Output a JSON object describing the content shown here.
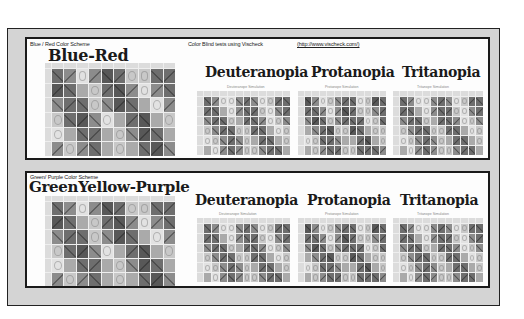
{
  "header": {
    "tests_label": "Color Blind tests using Vischeck",
    "tests_link": "(http://www.vischeck.com/)"
  },
  "panels": [
    {
      "scheme_label": "Blue / Red Color Scheme",
      "title": "Blue-Red",
      "simulations": [
        {
          "title": "Deuteranopia",
          "subtitle": "Deuteranope Simulation"
        },
        {
          "title": "Protanopia",
          "subtitle": "Protanope Simulation"
        },
        {
          "title": "Tritanopia",
          "subtitle": "Tritanope Simulation"
        }
      ]
    },
    {
      "scheme_label": "Green/ Purple Color Scheme",
      "title": "GreenYellow-Purple",
      "simulations": [
        {
          "title": "Deuteranopia",
          "subtitle": "Deuteranope Simulation"
        },
        {
          "title": "Protanopia",
          "subtitle": "Protanope Simulation"
        },
        {
          "title": "Tritanopia",
          "subtitle": "Tritanope Simulation"
        }
      ]
    }
  ],
  "matrix": {
    "rows": 6,
    "cols": 10,
    "shades": [
      [
        5,
        4,
        1,
        4,
        6,
        5,
        2,
        2,
        5,
        5
      ],
      [
        6,
        5,
        3,
        2,
        5,
        6,
        4,
        1,
        4,
        5
      ],
      [
        4,
        5,
        5,
        2,
        4,
        6,
        5,
        3,
        1,
        4
      ],
      [
        2,
        5,
        6,
        4,
        1,
        3,
        5,
        6,
        3,
        2
      ],
      [
        1,
        3,
        5,
        5,
        3,
        2,
        4,
        6,
        5,
        3
      ],
      [
        4,
        2,
        4,
        5,
        3,
        2,
        3,
        5,
        6,
        4
      ]
    ],
    "sim_shades": [
      [
        5,
        4,
        1,
        1,
        4,
        5,
        4,
        1,
        2,
        5,
        5
      ],
      [
        5,
        5,
        3,
        1,
        4,
        5,
        5,
        2,
        1,
        4,
        5
      ],
      [
        4,
        5,
        5,
        2,
        3,
        5,
        5,
        4,
        1,
        2,
        4
      ],
      [
        2,
        4,
        5,
        5,
        2,
        2,
        5,
        5,
        3,
        1,
        2
      ],
      [
        1,
        2,
        4,
        5,
        4,
        2,
        3,
        5,
        5,
        3,
        2
      ],
      [
        3,
        1,
        4,
        5,
        4,
        2,
        2,
        4,
        5,
        5,
        3
      ]
    ],
    "palette": [
      "#f4f4f4",
      "#e2e2e2",
      "#c8c8c8",
      "#aaaaaa",
      "#8c8c8c",
      "#6e6e6e",
      "#585858"
    ]
  }
}
